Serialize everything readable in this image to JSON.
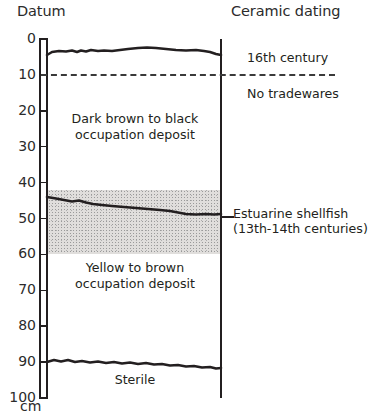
{
  "header": {
    "left_title": "Datum",
    "right_title": "Ceramic dating"
  },
  "axis": {
    "unit_label": "cm",
    "ticks": [
      {
        "value": 0,
        "label": "0"
      },
      {
        "value": 10,
        "label": "10"
      },
      {
        "value": 20,
        "label": "20"
      },
      {
        "value": 30,
        "label": "30"
      },
      {
        "value": 40,
        "label": "40"
      },
      {
        "value": 50,
        "label": "50"
      },
      {
        "value": 60,
        "label": "60"
      },
      {
        "value": 70,
        "label": "70"
      },
      {
        "value": 80,
        "label": "80"
      },
      {
        "value": 90,
        "label": "90"
      },
      {
        "value": 100,
        "label": "100"
      }
    ],
    "min": 0,
    "max": 100
  },
  "units": {
    "dark": {
      "line1": "Dark brown to black",
      "line2": "occupation deposit"
    },
    "yellow": {
      "line1": "Yellow to brown",
      "line2": "occupation deposit"
    },
    "sterile": {
      "line1": "Sterile"
    }
  },
  "annotations": {
    "century_16th": "16th century",
    "no_tradewares": "No tradewares",
    "shellfish_line1": "Estuarine shellfish",
    "shellfish_line2": "(13th-14th centuries)"
  },
  "colors": {
    "ink": "#231f20",
    "stipple_fill": "#e0dedc",
    "stipple_dot": "#9a9a9a",
    "background": "#ffffff"
  },
  "chart_data": {
    "type": "area",
    "ylabel": "Datum (cm below datum)",
    "ylim": [
      0,
      100
    ],
    "grid": false,
    "legend": "none",
    "horizons": [
      {
        "name": "ground surface",
        "depth_cm": 4
      },
      {
        "name": "ceramic horizon (dashed)",
        "depth_cm": 10
      },
      {
        "name": "top of estuarine shellfish band",
        "depth_cm": 42
      },
      {
        "name": "shellfish contour (left)",
        "depth_cm": 44
      },
      {
        "name": "shellfish contour (right)",
        "depth_cm": 48
      },
      {
        "name": "base of estuarine shellfish band",
        "depth_cm": 60
      },
      {
        "name": "top of sterile",
        "depth_cm": 90
      }
    ],
    "layers": [
      {
        "name": "Dark brown to black occupation deposit",
        "top_cm": 4,
        "bottom_cm": 45
      },
      {
        "name": "Estuarine shellfish",
        "top_cm": 42,
        "bottom_cm": 60,
        "date": "13th-14th centuries"
      },
      {
        "name": "Yellow to brown occupation deposit",
        "top_cm": 45,
        "bottom_cm": 90
      },
      {
        "name": "Sterile",
        "top_cm": 90,
        "bottom_cm": 100
      }
    ],
    "dating": [
      {
        "label": "16th century",
        "depth_cm": 7
      },
      {
        "label": "No tradewares",
        "depth_cm": 17
      },
      {
        "label": "Estuarine shellfish (13th-14th centuries)",
        "depth_cm": 49
      }
    ]
  }
}
